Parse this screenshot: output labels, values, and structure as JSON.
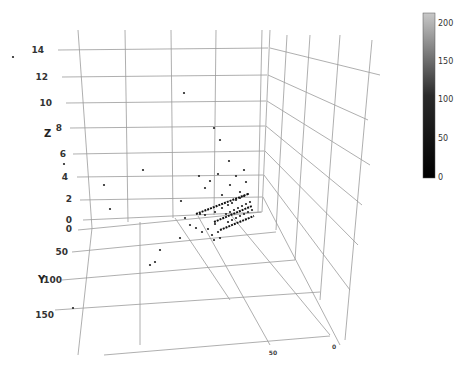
{
  "chart_data": {
    "type": "scatter3d",
    "title": "",
    "axes": {
      "x": {
        "label": "",
        "ticks": [
          "0",
          "50"
        ],
        "range": [
          0,
          60
        ]
      },
      "y": {
        "label": "Y",
        "ticks": [
          "0",
          "50",
          "100",
          "150"
        ],
        "range": [
          0,
          170
        ]
      },
      "z": {
        "label": "Z",
        "ticks": [
          "0",
          "2",
          "4",
          "6",
          "8",
          "10",
          "12",
          "14"
        ],
        "range": [
          0,
          15
        ]
      }
    },
    "colorbar": {
      "ticks": [
        "0",
        "50",
        "100",
        "150",
        "200"
      ],
      "range": [
        0,
        210
      ],
      "colorscale": [
        "#000000",
        "#c8c8c8"
      ]
    },
    "grid": true,
    "points_screen": [
      [
        13,
        57
      ],
      [
        184,
        93
      ],
      [
        214,
        128
      ],
      [
        220,
        140
      ],
      [
        229,
        161
      ],
      [
        64,
        164
      ],
      [
        104,
        185
      ],
      [
        143,
        170
      ],
      [
        110,
        209
      ],
      [
        181,
        201
      ],
      [
        199,
        176
      ],
      [
        205,
        188
      ],
      [
        210,
        181
      ],
      [
        218,
        174
      ],
      [
        222,
        195
      ],
      [
        230,
        185
      ],
      [
        236,
        176
      ],
      [
        240,
        192
      ],
      [
        244,
        170
      ],
      [
        246,
        182
      ],
      [
        200,
        214
      ],
      [
        205,
        215
      ],
      [
        215,
        212
      ],
      [
        222,
        208
      ],
      [
        228,
        205
      ],
      [
        232,
        203
      ],
      [
        236,
        200
      ],
      [
        240,
        198
      ],
      [
        244,
        196
      ],
      [
        248,
        194
      ],
      [
        226,
        214
      ],
      [
        230,
        212
      ],
      [
        234,
        210
      ],
      [
        238,
        208
      ],
      [
        242,
        206
      ],
      [
        246,
        204
      ],
      [
        250,
        202
      ],
      [
        228,
        222
      ],
      [
        232,
        220
      ],
      [
        236,
        218
      ],
      [
        240,
        216
      ],
      [
        244,
        214
      ],
      [
        248,
        212
      ],
      [
        252,
        210
      ],
      [
        185,
        218
      ],
      [
        190,
        225
      ],
      [
        196,
        228
      ],
      [
        202,
        232
      ],
      [
        208,
        229
      ],
      [
        212,
        235
      ],
      [
        218,
        232
      ],
      [
        214,
        240
      ],
      [
        220,
        238
      ],
      [
        180,
        238
      ],
      [
        150,
        265
      ],
      [
        155,
        262
      ],
      [
        73,
        308
      ],
      [
        160,
        250
      ],
      [
        215,
        224
      ]
    ]
  },
  "labels": {
    "z_axis": "Z",
    "y_axis": "Y",
    "z_ticks": [
      "14",
      "12",
      "10",
      "8",
      "6",
      "4",
      "2",
      "0"
    ],
    "y_ticks": [
      "0",
      "50",
      "100",
      "150"
    ],
    "x_ticks": [
      "50",
      "0"
    ],
    "cb_ticks": [
      "200",
      "150",
      "100",
      "50",
      "0"
    ]
  }
}
